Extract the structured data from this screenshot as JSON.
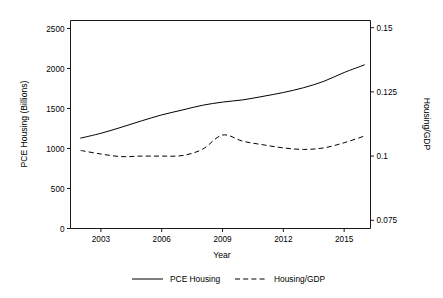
{
  "chart_data": {
    "type": "line",
    "title": "",
    "xlabel": "Year",
    "ylabel": "PCE Housing (Billions)",
    "y2label": "Housing/GDP",
    "grid": false,
    "legend_position": "bottom",
    "xlim": [
      2001.5,
      2016.3
    ],
    "ylim": [
      0,
      2600
    ],
    "y2lim": [
      0.0718,
      0.1528
    ],
    "xticks": [
      2003,
      2006,
      2009,
      2012,
      2015
    ],
    "xtick_labels": [
      "2003",
      "2006",
      "2009",
      "2012",
      "2015"
    ],
    "yticks": [
      0,
      500,
      1000,
      1500,
      2000,
      2500
    ],
    "ytick_labels": [
      "0",
      "500",
      "1000",
      "1500",
      "2000",
      "2500"
    ],
    "y2ticks": [
      0.075,
      0.1,
      0.125,
      0.15
    ],
    "y2tick_labels": [
      "0.075",
      "0.1",
      "0.125",
      "0.15"
    ],
    "x": [
      2002,
      2003,
      2004,
      2005,
      2006,
      2007,
      2008,
      2009,
      2010,
      2011,
      2012,
      2013,
      2014,
      2015,
      2016
    ],
    "series": [
      {
        "name": "PCE Housing",
        "axis": "left",
        "style": "solid",
        "values": [
          1130,
          1190,
          1265,
          1345,
          1420,
          1480,
          1540,
          1580,
          1608,
          1652,
          1700,
          1760,
          1840,
          1950,
          2045
        ]
      },
      {
        "name": "Housing/GDP",
        "axis": "right",
        "style": "dashed",
        "values": [
          0.1022,
          0.1008,
          0.0998,
          0.1,
          0.1,
          0.1002,
          0.1026,
          0.1082,
          0.1058,
          0.1044,
          0.1032,
          0.1026,
          0.1032,
          0.1052,
          0.1078
        ]
      }
    ]
  },
  "legend": {
    "items": [
      {
        "label": "PCE Housing",
        "style": "solid"
      },
      {
        "label": "Housing/GDP",
        "style": "dashed"
      }
    ]
  },
  "colors": {
    "line": "#000000",
    "axis": "#000000",
    "background": "#ffffff"
  }
}
